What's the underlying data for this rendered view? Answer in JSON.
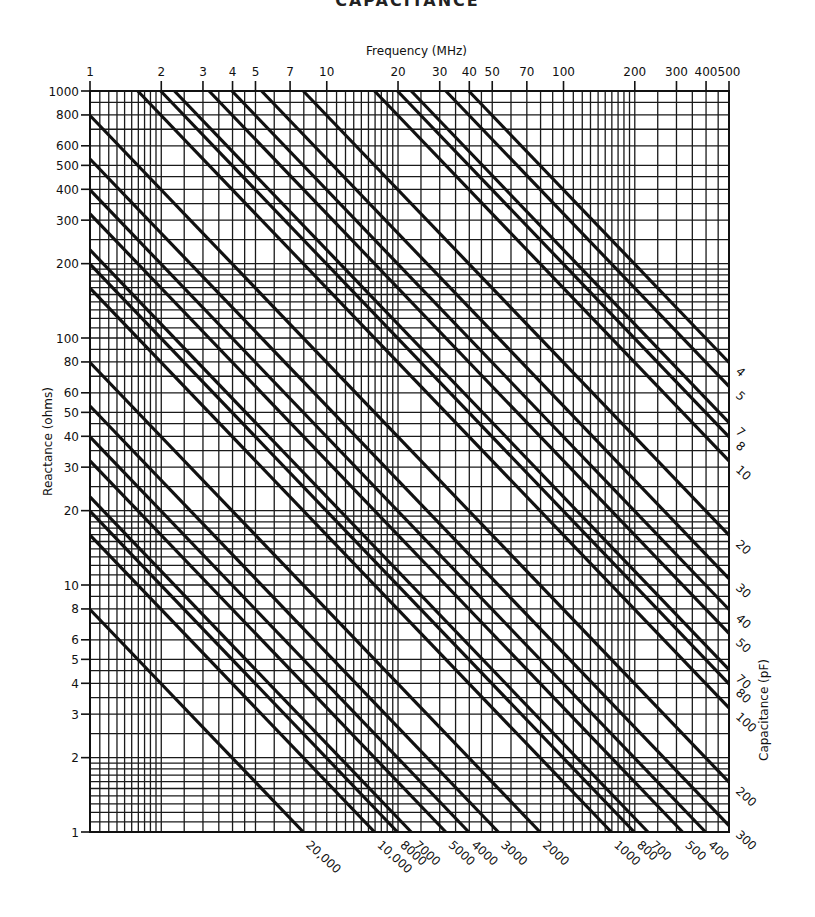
{
  "chart_data": {
    "type": "line",
    "title": "CAPACITANCE",
    "subtitle": "Reactance vs frequency nomograph, X = 1/(2*pi*f*C)",
    "xlabel": "Frequency (MHz)",
    "ylabel": "Reactance (ohms)",
    "series_axis_label": "Capacitance (pF)",
    "xscale": "log",
    "yscale": "log",
    "xlim": [
      1,
      500
    ],
    "ylim": [
      1,
      1000
    ],
    "grid": true,
    "x_ticks": [
      1,
      2,
      3,
      4,
      5,
      7,
      10,
      20,
      30,
      40,
      50,
      70,
      100,
      200,
      300,
      400,
      500
    ],
    "x_tick_labels": [
      "1",
      "2",
      "3",
      "4",
      "5",
      "7",
      "10",
      "20",
      "30",
      "40",
      "50",
      "70",
      "100",
      "200",
      "300",
      "400",
      "500"
    ],
    "y_ticks": [
      1,
      2,
      3,
      4,
      5,
      6,
      8,
      10,
      20,
      30,
      40,
      50,
      60,
      80,
      100,
      200,
      300,
      400,
      500,
      600,
      800,
      1000
    ],
    "y_tick_labels": [
      "1",
      "2",
      "3",
      "4",
      "5",
      "6",
      "8",
      "10",
      "20",
      "30",
      "40",
      "50",
      "60",
      "80",
      "100",
      "200",
      "300",
      "400",
      "500",
      "600",
      "800",
      "1000"
    ],
    "series": [
      {
        "name": "4",
        "capacitance_pF": 4,
        "label_side": "right"
      },
      {
        "name": "5",
        "capacitance_pF": 5,
        "label_side": "right"
      },
      {
        "name": "7",
        "capacitance_pF": 7,
        "label_side": "right"
      },
      {
        "name": "8",
        "capacitance_pF": 8,
        "label_side": "right"
      },
      {
        "name": "10",
        "capacitance_pF": 10,
        "label_side": "right"
      },
      {
        "name": "20",
        "capacitance_pF": 20,
        "label_side": "right"
      },
      {
        "name": "30",
        "capacitance_pF": 30,
        "label_side": "right"
      },
      {
        "name": "40",
        "capacitance_pF": 40,
        "label_side": "right"
      },
      {
        "name": "50",
        "capacitance_pF": 50,
        "label_side": "right"
      },
      {
        "name": "70",
        "capacitance_pF": 70,
        "label_side": "right"
      },
      {
        "name": "80",
        "capacitance_pF": 80,
        "label_side": "right"
      },
      {
        "name": "100",
        "capacitance_pF": 100,
        "label_side": "right"
      },
      {
        "name": "200",
        "capacitance_pF": 200,
        "label_side": "right"
      },
      {
        "name": "300",
        "capacitance_pF": 300,
        "label_side": "right"
      },
      {
        "name": "400",
        "capacitance_pF": 400,
        "label_side": "bottom"
      },
      {
        "name": "500",
        "capacitance_pF": 500,
        "label_side": "bottom"
      },
      {
        "name": "700",
        "capacitance_pF": 700,
        "label_side": "bottom"
      },
      {
        "name": "800",
        "capacitance_pF": 800,
        "label_side": "bottom"
      },
      {
        "name": "1000",
        "capacitance_pF": 1000,
        "label_side": "bottom"
      },
      {
        "name": "2000",
        "capacitance_pF": 2000,
        "label_side": "bottom"
      },
      {
        "name": "3000",
        "capacitance_pF": 3000,
        "label_side": "bottom"
      },
      {
        "name": "4000",
        "capacitance_pF": 4000,
        "label_side": "bottom"
      },
      {
        "name": "5000",
        "capacitance_pF": 5000,
        "label_side": "bottom"
      },
      {
        "name": "7000",
        "capacitance_pF": 7000,
        "label_side": "bottom"
      },
      {
        "name": "8000",
        "capacitance_pF": 8000,
        "label_side": "bottom"
      },
      {
        "name": "10,000",
        "capacitance_pF": 10000,
        "label_side": "bottom"
      },
      {
        "name": "20,000",
        "capacitance_pF": 20000,
        "label_side": "bottom"
      }
    ],
    "sample_points": [
      {
        "C_pF": 20000,
        "f_MHz": 1,
        "X_ohms": 7.96
      },
      {
        "C_pF": 200,
        "f_MHz": 1,
        "X_ohms": 796
      },
      {
        "C_pF": 100,
        "f_MHz": 1.59,
        "X_ohms": 1000
      },
      {
        "C_pF": 4,
        "f_MHz": 500,
        "X_ohms": 79.6
      },
      {
        "C_pF": 300,
        "f_MHz": 500,
        "X_ohms": 1.06
      }
    ]
  },
  "colors": {
    "ink": "#111111",
    "grid": "#1a1a1a",
    "background": "#ffffff"
  }
}
